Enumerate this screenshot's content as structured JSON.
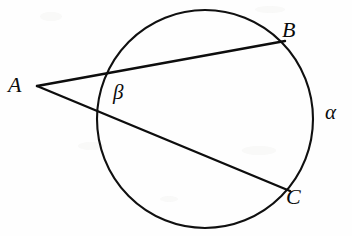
{
  "figure": {
    "type": "geometry-diagram",
    "background_color": "#fefefe",
    "ink_color": "#0d0d0d",
    "width": 352,
    "height": 236
  },
  "circle": {
    "name": "main-circle",
    "center_x": 205,
    "center_y": 119,
    "radius": 108,
    "stroke_width": 2.1
  },
  "points": {
    "A": {
      "label": "A",
      "x": 37,
      "y": 86,
      "position": "external-left"
    },
    "B": {
      "label": "B",
      "x": 283,
      "y": 42,
      "position": "on-circle-upper-right"
    },
    "C": {
      "label": "C",
      "x": 288,
      "y": 190,
      "position": "on-circle-lower-right"
    }
  },
  "segments": [
    {
      "name": "secant-AB",
      "from": "A",
      "to": "B",
      "x1": 37,
      "y1": 86,
      "x2": 285,
      "y2": 41
    },
    {
      "name": "secant-AC",
      "from": "A",
      "to": "C",
      "x1": 37,
      "y1": 86,
      "x2": 290,
      "y2": 191
    }
  ],
  "angles": {
    "beta": {
      "label": "β",
      "name": "angle-beta",
      "vertex": "A",
      "description": "angle between the two secants at external point A, marked inside circle near left",
      "x": 122,
      "y": 95
    },
    "alpha": {
      "label": "α",
      "name": "arc-alpha",
      "description": "arc BC on the far right of the circle",
      "x": 334,
      "y": 114
    }
  },
  "labels": {
    "A": "A",
    "B": "B",
    "C": "C",
    "alpha": "α",
    "beta": "β"
  }
}
